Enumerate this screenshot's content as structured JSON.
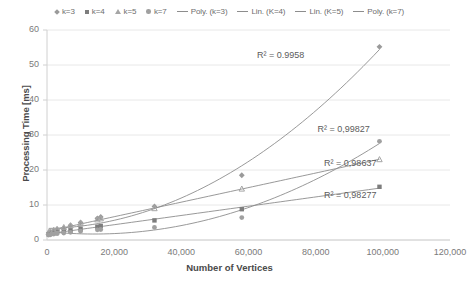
{
  "chart_data": {
    "type": "scatter",
    "title": "",
    "xlabel": "Number of Vertices",
    "ylabel": "Processing Time [ms]",
    "xlim": [
      0,
      120000
    ],
    "ylim": [
      0,
      60
    ],
    "xticks": [
      "0",
      "20,000",
      "40,000",
      "60,000",
      "80,000",
      "100,000",
      "120,000"
    ],
    "xtick_values": [
      0,
      20000,
      40000,
      60000,
      80000,
      100000,
      120000
    ],
    "yticks": [
      "0",
      "10",
      "20",
      "30",
      "40",
      "50",
      "60"
    ],
    "ytick_values": [
      0,
      10,
      20,
      30,
      40,
      50,
      60
    ],
    "grid": "horizontal",
    "legend_position": "top",
    "series": [
      {
        "name": "k=3",
        "marker": "diamond",
        "color": "#9a9a9a",
        "x": [
          500,
          1000,
          2000,
          3000,
          5000,
          7000,
          10000,
          15000,
          16000,
          32000,
          58000,
          99000
        ],
        "y": [
          2.0,
          2.3,
          2.6,
          3.0,
          3.4,
          4.2,
          5.0,
          6.2,
          6.6,
          9.6,
          18.5,
          55.2
        ]
      },
      {
        "name": "k=4",
        "marker": "square",
        "color": "#7d7d7d",
        "x": [
          500,
          1000,
          2000,
          3000,
          5000,
          7000,
          10000,
          15000,
          16000,
          32000,
          58000,
          99000
        ],
        "y": [
          1.6,
          1.8,
          2.0,
          2.2,
          2.5,
          2.8,
          3.2,
          3.8,
          4.0,
          5.6,
          8.8,
          15.2
        ]
      },
      {
        "name": "k=5",
        "marker": "triangle",
        "color": "#a6a6a6",
        "x": [
          500,
          1000,
          2000,
          3000,
          5000,
          7000,
          10000,
          15000,
          16000,
          32000,
          58000,
          99000
        ],
        "y": [
          2.2,
          2.5,
          2.8,
          3.1,
          3.6,
          4.1,
          4.8,
          5.8,
          6.1,
          9.0,
          14.6,
          23.0
        ]
      },
      {
        "name": "k=7",
        "marker": "circle",
        "color": "#a0a0a0",
        "x": [
          500,
          1000,
          2000,
          3000,
          5000,
          7000,
          10000,
          15000,
          16000,
          32000,
          58000,
          99000
        ],
        "y": [
          1.4,
          1.5,
          1.7,
          1.8,
          2.0,
          2.2,
          2.5,
          2.9,
          3.0,
          3.6,
          6.4,
          28.2
        ]
      }
    ],
    "trendlines": [
      {
        "name": "Poly. (k=3)",
        "type": "polynomial",
        "color": "#8d8d8d",
        "r_squared_label": "R² = 0.9958",
        "r_squared": 0.9958,
        "label_x": 78000,
        "label_y": 52.5
      },
      {
        "name": "Lin. (K=4)",
        "type": "linear",
        "color": "#8d8d8d",
        "r_squared_label": "R² = 0,98277",
        "r_squared": 0.98277,
        "label_x": 98000,
        "label_y": 12.6
      },
      {
        "name": "Lin. (K=5)",
        "type": "linear",
        "color": "#8d8d8d",
        "r_squared_label": "R² = 0,98637",
        "r_squared": 0.98637,
        "label_x": 98000,
        "label_y": 21.8
      },
      {
        "name": "Poly. (k=7)",
        "type": "polynomial",
        "color": "#8d8d8d",
        "r_squared_label": "R² = 0,99827",
        "r_squared": 0.99827,
        "label_x": 96000,
        "label_y": 31.5
      }
    ]
  },
  "legend": {
    "items": [
      {
        "label": "k=3",
        "marker": "diamond-marker"
      },
      {
        "label": "k=4",
        "marker": "square-marker"
      },
      {
        "label": "k=5",
        "marker": "triangle-marker"
      },
      {
        "label": "k=7",
        "marker": "circle-marker"
      },
      {
        "label": "Poly. (k=3)",
        "marker": "line-marker"
      },
      {
        "label": "Lin. (K=4)",
        "marker": "line-marker"
      },
      {
        "label": "Lin. (K=5)",
        "marker": "line-marker"
      },
      {
        "label": "Poly. (k=7)",
        "marker": "line-marker"
      }
    ]
  },
  "axes": {
    "y_title": "Processing Time [ms]",
    "x_title": "Number of Vertices",
    "y_labels": [
      "60",
      "50",
      "40",
      "30",
      "20",
      "10",
      "0"
    ],
    "x_labels": [
      "0",
      "20,000",
      "40,000",
      "60,000",
      "80,000",
      "100,000",
      "120,000"
    ]
  },
  "annotations": [
    {
      "text": "R² = 0.9958"
    },
    {
      "text": "R² = 0,99827"
    },
    {
      "text": "R² = 0,98637"
    },
    {
      "text": "R² = 0,98277"
    }
  ],
  "colors": {
    "gridline": "#e8e8e8",
    "axis": "#d0d0d0",
    "text": "#7a7a7a",
    "title_text": "#4a4a4a",
    "trendline": "#8d8d8d"
  }
}
